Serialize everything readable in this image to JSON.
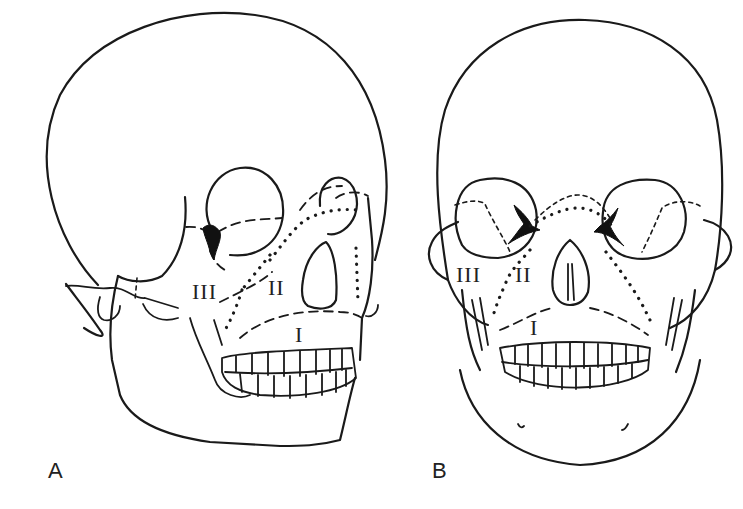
{
  "figure": {
    "panels": [
      {
        "id": "A",
        "label": "A",
        "view": "lateral-oblique skull",
        "regions": [
          "I",
          "II",
          "III"
        ]
      },
      {
        "id": "B",
        "label": "B",
        "view": "frontal skull",
        "regions": [
          "I",
          "II",
          "III"
        ]
      }
    ],
    "line_color": "#1a1a1a",
    "background": "#ffffff"
  }
}
